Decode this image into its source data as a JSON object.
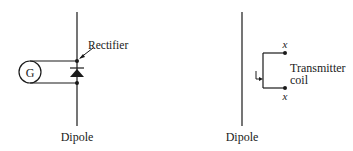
{
  "left_figure": {
    "dipole_label": "Dipole",
    "rectifier_label": "Rectifier",
    "generator_label": "G"
  },
  "right_figure": {
    "dipole_label": "Dipole",
    "coil_label_line1": "Transmitter",
    "coil_label_line2": "coil",
    "terminal_top_label": "x",
    "terminal_bottom_label": "x"
  },
  "colors": {
    "ink": "#1a1a1a",
    "background": "#ffffff"
  }
}
